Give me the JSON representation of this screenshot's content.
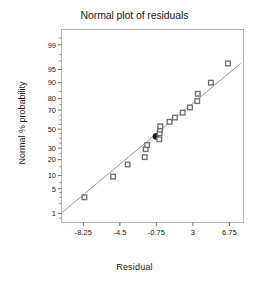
{
  "chart_data": {
    "type": "scatter",
    "title": "Normal plot of residuals",
    "xlabel": "Residual",
    "ylabel": "Normal % probability",
    "grid": false,
    "legend": "none",
    "xlim": [
      -10.5,
      8.2
    ],
    "xticks": [
      "-8.25",
      "-4.5",
      "-0.75",
      "3",
      "6.75"
    ],
    "xtick_values": [
      -8.25,
      -4.5,
      -0.75,
      3,
      6.75
    ],
    "ylim_percent": [
      0.5,
      99.7
    ],
    "yticks": [
      "99",
      "95",
      "90",
      "80",
      "70",
      "50",
      "30",
      "20",
      "10",
      "5",
      "1"
    ],
    "ytick_values": [
      99,
      95,
      90,
      80,
      70,
      50,
      30,
      20,
      10,
      5,
      1
    ],
    "yscale": "normal-probability",
    "reference_line": {
      "label": "normal reference line",
      "x_start": -10.4,
      "y_start_percent": 1.1,
      "x_end": 7.9,
      "y_end_percent": 96.5,
      "color": "#8c8c8c"
    },
    "marker_style": "open-square",
    "marker_color": "#6f6f6f",
    "highlight_marker_color": "#1a1a1a",
    "points": [
      {
        "x": -8.15,
        "y": 3.0,
        "highlight": false
      },
      {
        "x": -5.2,
        "y": 9.5,
        "highlight": false
      },
      {
        "x": -3.7,
        "y": 16.5,
        "highlight": false
      },
      {
        "x": -1.95,
        "y": 22.0,
        "highlight": false
      },
      {
        "x": -1.85,
        "y": 29.0,
        "highlight": false
      },
      {
        "x": -1.7,
        "y": 33.0,
        "highlight": false
      },
      {
        "x": -0.8,
        "y": 42.0,
        "highlight": true
      },
      {
        "x": -0.45,
        "y": 39.0,
        "highlight": false
      },
      {
        "x": -0.42,
        "y": 45.5,
        "highlight": false
      },
      {
        "x": -0.38,
        "y": 49.5,
        "highlight": false
      },
      {
        "x": -0.35,
        "y": 53.0,
        "highlight": false
      },
      {
        "x": 0.6,
        "y": 58.0,
        "highlight": false
      },
      {
        "x": 1.15,
        "y": 62.5,
        "highlight": false
      },
      {
        "x": 1.95,
        "y": 67.5,
        "highlight": false
      },
      {
        "x": 2.7,
        "y": 72.5,
        "highlight": false
      },
      {
        "x": 3.45,
        "y": 78.0,
        "highlight": false
      },
      {
        "x": 3.5,
        "y": 83.5,
        "highlight": false
      },
      {
        "x": 4.85,
        "y": 90.0,
        "highlight": false
      },
      {
        "x": 6.6,
        "y": 96.5,
        "highlight": false
      }
    ],
    "frame_color": "#b5b5b5",
    "axis_color": "#6f6f6f",
    "background": "#ffffff"
  }
}
